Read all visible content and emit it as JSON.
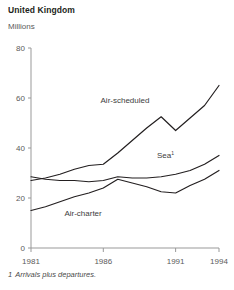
{
  "header": {
    "title": "United Kingdom",
    "subtitle": "Millions"
  },
  "footnote": {
    "marker": "1",
    "text": "Arrivals plus departures."
  },
  "colors": {
    "line": "#231f20",
    "axis": "#999999",
    "text": "#231f20",
    "muted_text": "#5a5a5a",
    "background": "#ffffff"
  },
  "chart_data": {
    "type": "line",
    "title": "United Kingdom",
    "subtitle": "Millions",
    "xlabel": "",
    "ylabel": "Millions",
    "xlim": [
      1981,
      1994
    ],
    "ylim": [
      0,
      80
    ],
    "yticks": [
      0,
      20,
      40,
      60,
      80
    ],
    "ytick_labels": [
      "0",
      "20",
      "40",
      "60",
      "80"
    ],
    "xticks": [
      1981,
      1986,
      1991,
      1994
    ],
    "xtick_labels": [
      "1981",
      "1986",
      "1991",
      "1994"
    ],
    "grid": false,
    "legend": "inline-labels",
    "x": [
      1981,
      1982,
      1983,
      1984,
      1985,
      1986,
      1987,
      1988,
      1989,
      1990,
      1991,
      1992,
      1993,
      1994
    ],
    "series": [
      {
        "name": "Air-scheduled",
        "label": "Air-scheduled",
        "label_superscript": "",
        "values": [
          27.0,
          28.0,
          29.5,
          31.5,
          33.0,
          33.5,
          38.0,
          43.0,
          48.0,
          52.5,
          47.0,
          52.0,
          57.0,
          65.0
        ]
      },
      {
        "name": "Sea",
        "label": "Sea",
        "label_superscript": "1",
        "values": [
          28.5,
          27.5,
          27.0,
          27.0,
          26.5,
          27.0,
          28.5,
          28.0,
          28.0,
          28.5,
          29.5,
          31.0,
          33.5,
          37.0
        ]
      },
      {
        "name": "Air-charter",
        "label": "Air-charter",
        "label_superscript": "",
        "values": [
          15.0,
          16.5,
          18.5,
          20.5,
          22.0,
          24.0,
          27.5,
          26.0,
          24.5,
          22.5,
          22.0,
          25.0,
          27.5,
          31.0
        ]
      }
    ],
    "annotations": [
      {
        "text": "Air-scheduled",
        "x": 1987.5,
        "y": 58
      },
      {
        "text": "Sea",
        "x": 1990.3,
        "y": 36
      },
      {
        "text": "Air-charter",
        "x": 1984.6,
        "y": 13
      }
    ]
  }
}
